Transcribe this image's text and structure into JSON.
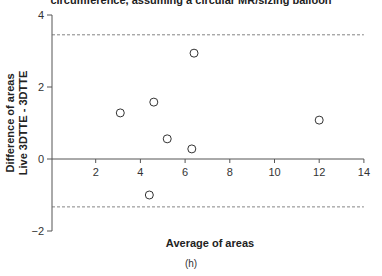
{
  "chart_data": {
    "type": "scatter",
    "title": "circumference, assuming a circular MR/sizing balloon",
    "xlabel": "Average of areas",
    "ylabel": [
      "Difference of areas",
      "Live 3DTTE - 3DTTE"
    ],
    "caption": "(h)",
    "xlim": [
      0,
      14
    ],
    "ylim": [
      -2,
      4
    ],
    "xticks": [
      2,
      4,
      6,
      8,
      10,
      12,
      14
    ],
    "yticks": [
      -2,
      0,
      2,
      4
    ],
    "grid": false,
    "reference_lines": [
      {
        "name": "upper limit of agreement",
        "y": 3.45,
        "style": "dashed"
      },
      {
        "name": "lower limit of agreement",
        "y": -1.33,
        "style": "dashed"
      }
    ],
    "points": [
      {
        "x": 3.1,
        "y": 1.28
      },
      {
        "x": 4.4,
        "y": -1.0
      },
      {
        "x": 4.6,
        "y": 1.58
      },
      {
        "x": 5.2,
        "y": 0.56
      },
      {
        "x": 6.3,
        "y": 0.28
      },
      {
        "x": 6.4,
        "y": 2.94
      },
      {
        "x": 12.0,
        "y": 1.08
      }
    ],
    "marker": "open-circle",
    "colors": {
      "axis": "#555555",
      "marker": "#333333",
      "dash": "#666666"
    }
  }
}
